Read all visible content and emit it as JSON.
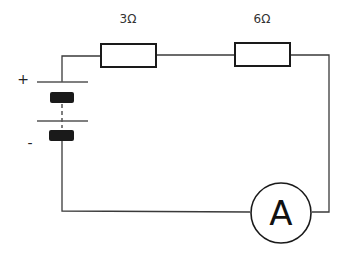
{
  "diagram": {
    "type": "series-circuit",
    "components": {
      "resistor_1": {
        "label": "3Ω"
      },
      "resistor_2": {
        "label": "6Ω"
      },
      "battery": {
        "positive_label": "+",
        "negative_label": "-"
      },
      "ammeter": {
        "label": "A"
      }
    },
    "colors": {
      "wire": "#3a3a3a",
      "component_stroke": "#1a1a1a",
      "background": "#ffffff"
    }
  }
}
